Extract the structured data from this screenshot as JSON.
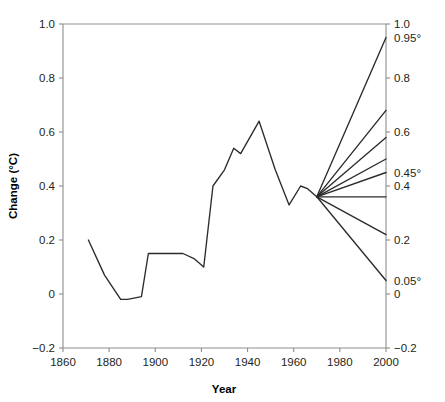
{
  "chart_data": {
    "type": "line",
    "title": "",
    "xlabel": "Year",
    "ylabel": "Change (°C)",
    "xlim": [
      1860,
      2000
    ],
    "ylim": [
      -0.2,
      1.0
    ],
    "grid": false,
    "legend": "none",
    "x_ticks": [
      1860,
      1880,
      1900,
      1920,
      1940,
      1960,
      1980,
      2000
    ],
    "x_tick_labels": [
      "1860",
      "1880",
      "1900",
      "1920",
      "1940",
      "1960",
      "1980",
      "2000"
    ],
    "y_ticks": [
      -0.2,
      0,
      0.2,
      0.4,
      0.6,
      0.8,
      1.0
    ],
    "y_tick_labels": [
      "−0.2",
      "0",
      "0.2",
      "0.4",
      "0.6",
      "0.8",
      "1.0"
    ],
    "right_axis": {
      "ticks": [
        -0.2,
        0,
        0.2,
        0.4,
        0.6,
        0.8,
        1.0
      ],
      "tick_labels": [
        "−0.2",
        "0",
        "0.2",
        "0.4",
        "0.6",
        "0.8",
        "1.0"
      ],
      "annotations": [
        {
          "value": 0.95,
          "label": "0.95°"
        },
        {
          "value": 0.45,
          "label": "0.45°"
        },
        {
          "value": 0.05,
          "label": "0.05°"
        }
      ]
    },
    "series": [
      {
        "name": "observed",
        "x": [
          1871,
          1878,
          1885,
          1888,
          1894,
          1897,
          1912,
          1917,
          1921,
          1925,
          1930,
          1934,
          1937,
          1945,
          1952,
          1958,
          1963,
          1966,
          1970
        ],
        "values": [
          0.2,
          0.07,
          -0.02,
          -0.02,
          -0.01,
          0.15,
          0.15,
          0.13,
          0.1,
          0.4,
          0.46,
          0.54,
          0.52,
          0.64,
          0.46,
          0.33,
          0.4,
          0.39,
          0.36
        ]
      },
      {
        "name": "projection-1",
        "x": [
          1970,
          2000
        ],
        "values": [
          0.36,
          0.95
        ]
      },
      {
        "name": "projection-2",
        "x": [
          1970,
          2000
        ],
        "values": [
          0.36,
          0.68
        ]
      },
      {
        "name": "projection-3",
        "x": [
          1970,
          2000
        ],
        "values": [
          0.36,
          0.58
        ]
      },
      {
        "name": "projection-4",
        "x": [
          1970,
          2000
        ],
        "values": [
          0.36,
          0.5
        ]
      },
      {
        "name": "projection-5",
        "x": [
          1970,
          2000
        ],
        "values": [
          0.36,
          0.45
        ]
      },
      {
        "name": "projection-6",
        "x": [
          1970,
          2000
        ],
        "values": [
          0.36,
          0.36
        ]
      },
      {
        "name": "projection-7",
        "x": [
          1970,
          2000
        ],
        "values": [
          0.36,
          0.22
        ]
      },
      {
        "name": "projection-8",
        "x": [
          1970,
          2000
        ],
        "values": [
          0.36,
          0.05
        ]
      }
    ]
  }
}
